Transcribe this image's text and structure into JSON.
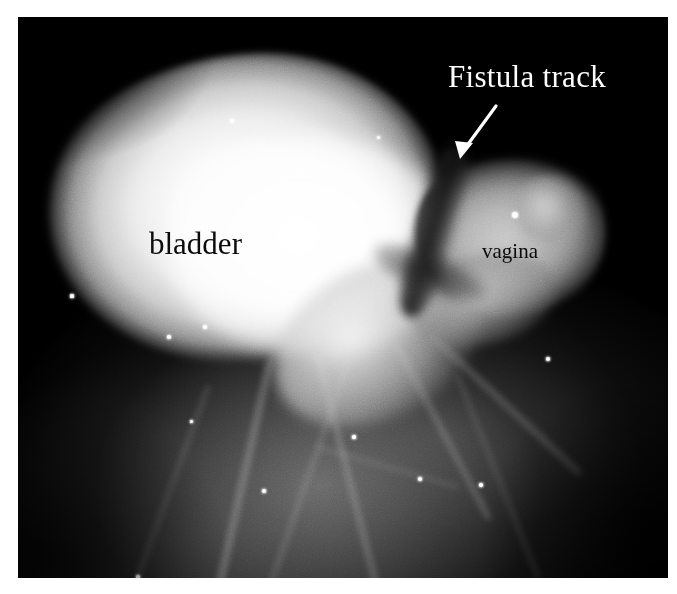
{
  "image": {
    "modality": "fluoroscopic radiograph",
    "study": "cystogram / vaginogram",
    "background_color": "#000000",
    "page_border_color": "#ffffff"
  },
  "annotations": {
    "fistula": {
      "label": "Fistula track",
      "color": "#ffffff",
      "pointer": "arrow",
      "arrow_from": [
        500,
        15
      ],
      "arrow_to": [
        28,
        61
      ]
    },
    "bladder": {
      "label": "bladder",
      "color": "#0b0b0b"
    },
    "vagina": {
      "label": "vagina",
      "color": "#0b0b0b"
    }
  },
  "specks": [
    {
      "x": 214,
      "y": 104,
      "r": 2.4
    },
    {
      "x": 187,
      "y": 310,
      "r": 2.0
    },
    {
      "x": 151,
      "y": 320,
      "r": 1.8
    },
    {
      "x": 497,
      "y": 198,
      "r": 3.2
    },
    {
      "x": 530,
      "y": 342,
      "r": 2.2
    },
    {
      "x": 246,
      "y": 474,
      "r": 1.9
    },
    {
      "x": 336,
      "y": 420,
      "r": 1.6
    },
    {
      "x": 402,
      "y": 462,
      "r": 2.1
    },
    {
      "x": 463,
      "y": 468,
      "r": 1.7
    },
    {
      "x": 54,
      "y": 279,
      "r": 1.6
    },
    {
      "x": 120,
      "y": 560,
      "r": 1.8
    },
    {
      "x": 173,
      "y": 404,
      "r": 1.5
    },
    {
      "x": 272,
      "y": 198,
      "r": 1.6
    },
    {
      "x": 360,
      "y": 120,
      "r": 1.5
    }
  ],
  "streaks": [
    {
      "x1": 255,
      "y1": 330,
      "x2": 200,
      "y2": 575,
      "w": 7,
      "o": 0.3
    },
    {
      "x1": 300,
      "y1": 340,
      "x2": 360,
      "y2": 575,
      "w": 6,
      "o": 0.26
    },
    {
      "x1": 330,
      "y1": 345,
      "x2": 250,
      "y2": 575,
      "w": 5,
      "o": 0.2
    },
    {
      "x1": 380,
      "y1": 330,
      "x2": 470,
      "y2": 500,
      "w": 6,
      "o": 0.24
    },
    {
      "x1": 415,
      "y1": 320,
      "x2": 560,
      "y2": 455,
      "w": 7,
      "o": 0.22
    },
    {
      "x1": 190,
      "y1": 370,
      "x2": 120,
      "y2": 560,
      "w": 5,
      "o": 0.16
    },
    {
      "x1": 440,
      "y1": 360,
      "x2": 520,
      "y2": 560,
      "w": 5,
      "o": 0.14
    },
    {
      "x1": 300,
      "y1": 430,
      "x2": 440,
      "y2": 470,
      "w": 4,
      "o": 0.15
    }
  ]
}
